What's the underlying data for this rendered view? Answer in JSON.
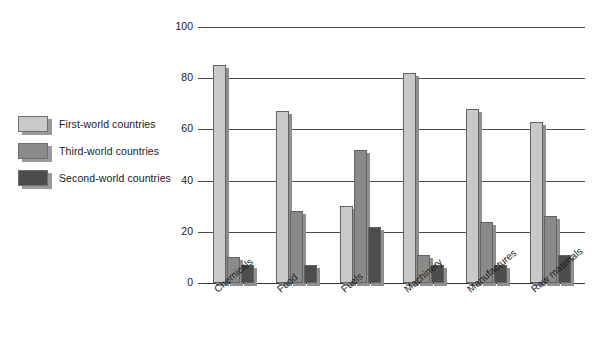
{
  "chart_data": {
    "type": "bar",
    "title": "",
    "xlabel": "",
    "ylabel": "",
    "ylim": [
      0,
      100
    ],
    "yticks": [
      0,
      20,
      40,
      60,
      80,
      100
    ],
    "grid": true,
    "legend_position": "left",
    "categories": [
      "Chemicals",
      "Food",
      "Fuels",
      "Machinery",
      "Manufactures",
      "Raw materials"
    ],
    "series": [
      {
        "name": "First-world countries",
        "color": "#c9c9c9",
        "values": [
          85,
          67,
          30,
          82,
          68,
          63
        ]
      },
      {
        "name": "Third-world countries",
        "color": "#8a8a8a",
        "values": [
          10,
          28,
          52,
          11,
          24,
          26
        ]
      },
      {
        "name": "Second-world countries",
        "color": "#4d4d4d",
        "values": [
          7,
          7,
          22,
          7,
          7,
          11
        ]
      }
    ]
  }
}
